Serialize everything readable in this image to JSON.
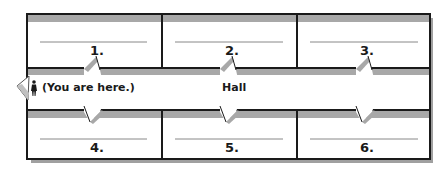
{
  "diagram": {
    "type": "floor-plan",
    "hall_label": "Hall",
    "you_are_here": "(You are here.)",
    "colors": {
      "wall": "#1a1a1a",
      "shadow": "#9a9a9a",
      "band": "#a8a8a8",
      "answer_line": "#888888"
    },
    "rooms": [
      {
        "label": "1.",
        "row": "top",
        "answer": ""
      },
      {
        "label": "2.",
        "row": "top",
        "answer": ""
      },
      {
        "label": "3.",
        "row": "top",
        "answer": ""
      },
      {
        "label": "4.",
        "row": "bottom",
        "answer": ""
      },
      {
        "label": "5.",
        "row": "bottom",
        "answer": ""
      },
      {
        "label": "6.",
        "row": "bottom",
        "answer": ""
      }
    ]
  }
}
